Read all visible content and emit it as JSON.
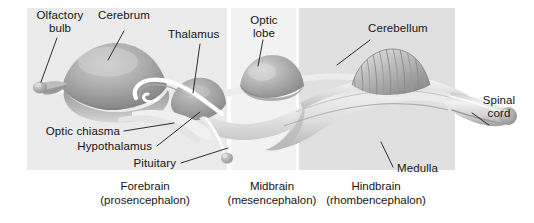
{
  "figure": {
    "type": "labeled-anatomical-diagram",
    "background": "#ffffff",
    "colors": {
      "band_forebrain": "#ebebeb",
      "band_midbrain": "#f2f2f2",
      "band_hindbrain": "#e0e0e0",
      "leader_line": "#1a1a1a",
      "text": "#141414",
      "tissue_light": "#f4f4f4",
      "tissue_mid": "#cfcfcf",
      "tissue_dark": "#8f8f8f",
      "tissue_shadow": "#6e6e6e"
    }
  },
  "bands": [
    {
      "key": "forebrain",
      "x": 27,
      "width": 200,
      "fill": "#ebebeb"
    },
    {
      "key": "midbrain",
      "x": 231,
      "width": 65,
      "fill": "#f2f2f2"
    },
    {
      "key": "hindbrain",
      "x": 299,
      "width": 156,
      "fill": "#e0e0e0"
    }
  ],
  "labels": {
    "olfactory_bulb": {
      "line1": "Olfactory",
      "line2": "bulb"
    },
    "cerebrum": "Cerebrum",
    "thalamus": "Thalamus",
    "optic_lobe": {
      "line1": "Optic",
      "line2": "lobe"
    },
    "cerebellum": "Cerebellum",
    "spinal_cord": {
      "line1": "Spinal",
      "line2": "cord"
    },
    "optic_chiasma": "Optic chiasma",
    "hypothalamus": "Hypothalamus",
    "pituitary": "Pituitary",
    "medulla": "Medulla"
  },
  "regions": [
    {
      "key": "forebrain",
      "name": "Forebrain",
      "alt": "(prosencephalon)"
    },
    {
      "key": "midbrain",
      "name": "Midbrain",
      "alt": "(mesencephalon)"
    },
    {
      "key": "hindbrain",
      "name": "Hindbrain",
      "alt": "(rhombencephalon)"
    }
  ]
}
